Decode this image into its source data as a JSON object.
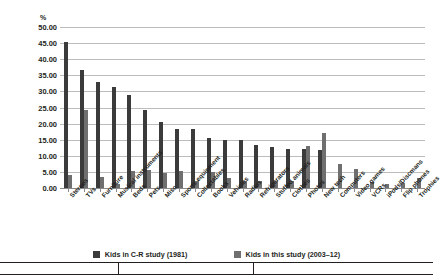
{
  "chart_data": {
    "type": "bar",
    "title": "",
    "xlabel": "",
    "ylabel": "%",
    "unit_label": "%",
    "ylim": [
      0,
      50
    ],
    "ytick_step": 5,
    "ytick_labels": [
      "50.00",
      "45.00",
      "40.00",
      "35.00",
      "30.00",
      "25.00",
      "20.00",
      "15.00",
      "10.00",
      "5.00",
      "0.00"
    ],
    "grid": true,
    "legend_position": "bottom",
    "categories": [
      "Stereos",
      "TVs",
      "Furniture",
      "Musical instruments",
      "Beds",
      "Pets",
      "Misc",
      "Sports equipment",
      "Collectables",
      "Books",
      "Vehicles",
      "Radios",
      "Refrigerators",
      "Stuffed animals",
      "Clothes",
      "Photos",
      "New tech",
      "Computers",
      "Video games",
      "VCRs",
      "iPods/Discmans",
      "Flip phones",
      "Trophies"
    ],
    "series": [
      {
        "name": "Kids in C-R study (1981)",
        "color": "#3b3b3b",
        "values": [
          45.5,
          36.7,
          32.8,
          31.5,
          29.0,
          24.3,
          20.5,
          18.3,
          18.4,
          15.5,
          14.8,
          14.8,
          13.5,
          12.8,
          12.2,
          12.2,
          11.8,
          0.0,
          0.0,
          0.0,
          0.0,
          0.0,
          0.0
        ]
      },
      {
        "name": "Kids in this study (2003–12)",
        "color": "#6f6f6f",
        "values": [
          4.0,
          24.3,
          3.5,
          1.2,
          5.2,
          5.5,
          4.8,
          5.3,
          2.3,
          5.0,
          3.0,
          2.3,
          2.3,
          2.3,
          2.3,
          13.2,
          17.0,
          7.4,
          6.0,
          1.8,
          1.1,
          1.5,
          3.0
        ]
      }
    ]
  },
  "legend": {
    "items": [
      {
        "label": "Kids in C-R study (1981)",
        "color": "#3b3b3b"
      },
      {
        "label": "Kids in this study (2003–12)",
        "color": "#6f6f6f"
      }
    ]
  }
}
